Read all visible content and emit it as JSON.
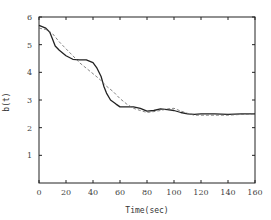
{
  "chart_data": {
    "type": "line",
    "title": "",
    "xlabel": "Time(sec)",
    "ylabel": "b(t)",
    "xlim": [
      0,
      160
    ],
    "ylim": [
      0,
      6
    ],
    "xticks": [
      0,
      20,
      40,
      60,
      80,
      100,
      120,
      140,
      160
    ],
    "yticks": [
      1,
      2,
      3,
      4,
      5,
      6
    ],
    "xtick_labels": [
      "0",
      "20",
      "40",
      "60",
      "80",
      "100",
      "120",
      "140",
      "160"
    ],
    "ytick_labels": [
      "1",
      "2",
      "3",
      "4",
      "5",
      "6"
    ],
    "grid": false,
    "legend": null,
    "series": [
      {
        "name": "solid",
        "style": "solid",
        "color": "#222222",
        "x": [
          0,
          5,
          8,
          10,
          12,
          15,
          20,
          25,
          30,
          35,
          40,
          43,
          46,
          48,
          50,
          53,
          57,
          60,
          70,
          75,
          80,
          85,
          90,
          95,
          100,
          105,
          110,
          115,
          120,
          130,
          140,
          150,
          160
        ],
        "y": [
          5.7,
          5.6,
          5.45,
          5.2,
          4.95,
          4.8,
          4.6,
          4.47,
          4.45,
          4.45,
          4.35,
          4.15,
          3.85,
          3.5,
          3.25,
          3.0,
          2.85,
          2.75,
          2.75,
          2.7,
          2.6,
          2.62,
          2.68,
          2.65,
          2.62,
          2.55,
          2.5,
          2.48,
          2.5,
          2.5,
          2.48,
          2.5,
          2.5
        ]
      },
      {
        "name": "dashed",
        "style": "dashed",
        "color": "#666666",
        "x": [
          0,
          5,
          10,
          15,
          20,
          25,
          30,
          35,
          40,
          45,
          50,
          55,
          60,
          65,
          70,
          75,
          80,
          85,
          90,
          95,
          100,
          105,
          110,
          115,
          120,
          130,
          140,
          150,
          160
        ],
        "y": [
          5.6,
          5.55,
          5.4,
          5.1,
          4.85,
          4.6,
          4.35,
          4.15,
          3.95,
          3.75,
          3.5,
          3.3,
          3.05,
          2.85,
          2.7,
          2.62,
          2.55,
          2.58,
          2.62,
          2.68,
          2.7,
          2.6,
          2.52,
          2.45,
          2.45,
          2.45,
          2.45,
          2.48,
          2.5
        ]
      }
    ]
  }
}
